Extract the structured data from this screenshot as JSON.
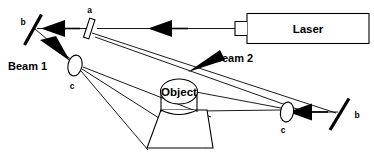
{
  "figure": {
    "background_color": "#ffffff",
    "line_color": "#000000"
  },
  "components": {
    "laser": {
      "label": "Laser",
      "name": "laser-source-box",
      "shape": "rectangle-with-aperture-stub"
    },
    "beam_splitter": {
      "label": "a",
      "name": "beam-splitter",
      "shape": "tilted-rectangle"
    },
    "mirror_top_left": {
      "label": "b",
      "name": "mirror-top-left",
      "shape": "diagonal-line"
    },
    "mirror_bottom_right": {
      "label": "b",
      "name": "mirror-bottom-right",
      "shape": "diagonal-line"
    },
    "lens_left": {
      "label": "c",
      "name": "diverging-lens-left",
      "shape": "ellipse"
    },
    "lens_right": {
      "label": "c",
      "name": "diverging-lens-right",
      "shape": "ellipse"
    },
    "object": {
      "label": "Object",
      "name": "object-cylinder",
      "shape": "cylinder"
    },
    "plate": {
      "label": "",
      "name": "holographic-plate",
      "shape": "trapezoid"
    }
  },
  "beams": {
    "beam1": {
      "label": "Beam 1",
      "name": "beam-1-label"
    },
    "beam2": {
      "label": "Beam 2",
      "name": "beam-2-label"
    }
  },
  "labels": {
    "splitter_a": "a",
    "mirror_b_left": "b",
    "mirror_b_right": "b",
    "lens_c_left": "c",
    "lens_c_right": "c",
    "object_text": "Object",
    "laser_text": "Laser",
    "beam1_text": "Beam 1",
    "beam2_text": "Beam 2"
  }
}
